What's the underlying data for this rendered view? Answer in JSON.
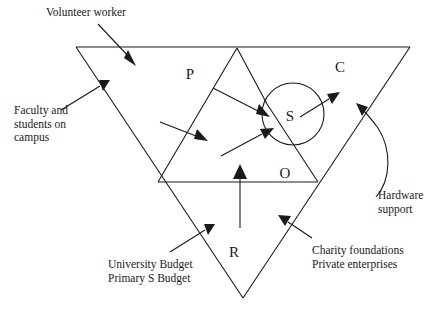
{
  "diagram": {
    "type": "venn-overlay-triangle-diagram",
    "background_color": "#ffffff",
    "line_color": "#1a1a1a",
    "nodes": [
      {
        "id": "P",
        "label": "P",
        "x": 190,
        "y": 79
      },
      {
        "id": "C",
        "label": "C",
        "x": 340,
        "y": 72
      },
      {
        "id": "S",
        "label": "S",
        "x": 290,
        "y": 121
      },
      {
        "id": "O",
        "label": "O",
        "x": 285,
        "y": 178
      },
      {
        "id": "R",
        "label": "R",
        "x": 234,
        "y": 257
      }
    ],
    "annotations": [
      {
        "id": "volunteer",
        "text": "Volunteer worker",
        "target": "top-edge-region"
      },
      {
        "id": "faculty",
        "text": "Faculty and\nstudents on\ncampus",
        "target": "left-edge-region"
      },
      {
        "id": "university",
        "text": "University Budget\nPrimary S Budget",
        "target": "bottom-left-edge-region"
      },
      {
        "id": "charity",
        "text": "Charity foundations\nPrivate enterprises",
        "target": "bottom-right-edge-region"
      },
      {
        "id": "hardware",
        "text": "Hardware\nsupport",
        "target": "right-edge-region"
      }
    ],
    "shapes": {
      "outer_triangle": "large downward-pointing triangle",
      "inner_triangle": "small triangle at apex P-S",
      "parallelogram": "quadrilateral region P",
      "circle": "circle S",
      "horizontal_divider": "line through O"
    }
  }
}
